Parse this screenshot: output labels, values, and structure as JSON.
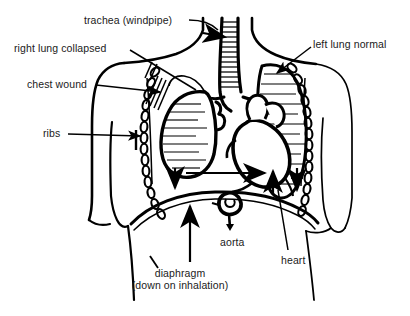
{
  "figure": {
    "background_color": "#ffffff",
    "ink_color": "#000000",
    "text_color": "#1a1a1a"
  },
  "labels": {
    "trachea": "trachea (windpipe)",
    "right_lung": "right lung collapsed",
    "chest_wound": "chest wound",
    "left_lung": "left lung normal",
    "ribs": "ribs",
    "aorta": "aorta",
    "heart": "heart",
    "diaphragm_line1": "diaphragm",
    "diaphragm_line2": "(down on inhalation)"
  },
  "parts": {
    "torso": "torso-outline",
    "neck": "neck-outline",
    "left_arm": "left-arm-outline",
    "right_arm": "right-arm-outline",
    "trachea_tube": "trachea-tube",
    "bronchi": "bronchi",
    "collapsed_lung": "collapsed-right-lung",
    "normal_lung": "normal-left-lung",
    "heart_shape": "heart-shape",
    "aorta_shape": "aorta-shape",
    "diaphragm_arc": "diaphragm-arc",
    "rib_chain_left": "rib-chain-left",
    "rib_chain_right": "rib-chain-right",
    "wound_hatch": "wound-hatch-marks"
  },
  "arrows": {
    "trachea_shift": "trachea-shift-arrow",
    "mediastinal_shift": "mediastinal-shift-arrow",
    "lung_collapse_down": "lung-collapse-down-arrow",
    "diaphragm_up": "diaphragm-up-arrow",
    "heart_up": "heart-up-arrow",
    "left_side_down": "left-side-down-arrow"
  }
}
